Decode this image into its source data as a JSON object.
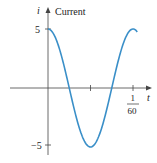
{
  "chart_data": {
    "type": "line",
    "title": "Current",
    "xlabel": "t",
    "ylabel": "i",
    "function": "i = 5 cos(120πt)",
    "x_ticks": [
      {
        "value": 0.008333,
        "label": ""
      },
      {
        "value": 0.016667,
        "label": "1/60"
      }
    ],
    "x_tick_label": {
      "numerator": "1",
      "denominator": "60"
    },
    "y_ticks": [
      {
        "value": 5,
        "label": "5"
      },
      {
        "value": -5,
        "label": "−5"
      }
    ],
    "xlim": [
      -0.0045,
      0.0193
    ],
    "ylim": [
      -5.5,
      5.5
    ],
    "amplitude": 5,
    "period": 0.016667,
    "x": [
      0,
      0.002083,
      0.004167,
      0.00625,
      0.008333,
      0.010417,
      0.0125,
      0.014583,
      0.016667,
      0.0175
    ],
    "y": [
      5,
      3.54,
      0,
      -3.54,
      -5,
      -3.54,
      0,
      3.54,
      5,
      4.62
    ],
    "series_color": "#3a8fc8",
    "grid": false,
    "legend": null
  },
  "labels": {
    "y_axis_symbol": "i",
    "title": "Current",
    "x_axis_symbol": "t",
    "y_tick_pos": "5",
    "y_tick_neg": "−5",
    "x_tick_num": "1",
    "x_tick_den": "60"
  }
}
